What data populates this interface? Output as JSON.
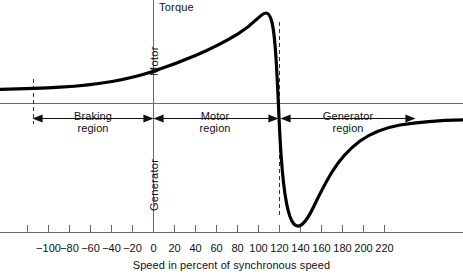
{
  "figure": {
    "background": "#ffffff",
    "ink_color": "#111111",
    "axis_color": "#6b6b6b",
    "curve_color": "#000000"
  },
  "labels": {
    "torque_axis": "Torque",
    "motor_axis": "Motor",
    "generator_axis": "Generator",
    "xaxis_title": "Speed in percent of synchronous speed"
  },
  "regions": [
    {
      "name": "braking",
      "line1": "Braking",
      "line2": "region",
      "from": -92,
      "to": 0
    },
    {
      "name": "motor",
      "line1": "Motor",
      "line2": "region",
      "from": 0,
      "to": 100
    },
    {
      "name": "generator",
      "line1": "Generator",
      "line2": "region",
      "from": 100,
      "to": 249
    }
  ],
  "chart_data": {
    "type": "line",
    "title": "",
    "xlabel": "Speed in percent of synchronous speed",
    "ylabel": "Torque",
    "xlim": [
      -126,
      229
    ],
    "ylim": [
      -1.45,
      1.75
    ],
    "grid": false,
    "legend": null,
    "annotations": [
      {
        "text": "Torque",
        "kind": "y-axis-title"
      },
      {
        "text": "Motor",
        "kind": "y-axis-positive-direction"
      },
      {
        "text": "Generator",
        "kind": "y-axis-negative-direction"
      },
      {
        "text": "Braking region",
        "kind": "region-span",
        "x_from": -92,
        "x_to": 0
      },
      {
        "text": "Motor region",
        "kind": "region-span",
        "x_from": 0,
        "x_to": 100
      },
      {
        "text": "Generator region",
        "kind": "region-span",
        "x_from": 100,
        "x_to": 249
      },
      {
        "text": "synchronous speed marker",
        "kind": "dashed-vertical",
        "x": 120
      },
      {
        "text": "braking boundary marker",
        "kind": "dashed-vertical",
        "x": -92
      }
    ],
    "xticks": [
      -100,
      -80,
      -60,
      -40,
      -20,
      0,
      20,
      40,
      60,
      80,
      100,
      120,
      140,
      160,
      180,
      200,
      220
    ],
    "xtick_labels": [
      "−100",
      "−80",
      "−60",
      "−40",
      "−20",
      "0",
      "20",
      "40",
      "60",
      "80",
      "100",
      "120",
      "140",
      "160",
      "180",
      "200",
      "220"
    ],
    "yticks": [],
    "ytick_labels": [],
    "series": [
      {
        "name": "Induction machine torque-speed characteristic",
        "color": "#000000",
        "x": [
          -126,
          -120,
          -110,
          -100,
          -92,
          -80,
          -70,
          -60,
          -50,
          -40,
          -30,
          -20,
          -10,
          0,
          10,
          20,
          30,
          40,
          50,
          60,
          70,
          78,
          84,
          88,
          92,
          96,
          100,
          104,
          108,
          112,
          116,
          120,
          126,
          132,
          140,
          150,
          160,
          170,
          180,
          190,
          200,
          210,
          220,
          229
        ],
        "y": [
          0.162,
          0.163,
          0.165,
          0.168,
          0.172,
          0.181,
          0.19,
          0.201,
          0.215,
          0.232,
          0.253,
          0.28,
          0.315,
          0.358,
          0.412,
          0.478,
          0.556,
          0.648,
          0.76,
          0.9,
          1.07,
          1.24,
          1.35,
          1.39,
          1.33,
          1.0,
          0.0,
          -0.72,
          -1.06,
          -1.2,
          -1.25,
          -1.245,
          -1.19,
          -1.1,
          -0.97,
          -0.83,
          -0.72,
          -0.63,
          -0.56,
          -0.5,
          -0.46,
          -0.42,
          -0.39,
          -0.375
        ]
      }
    ]
  }
}
